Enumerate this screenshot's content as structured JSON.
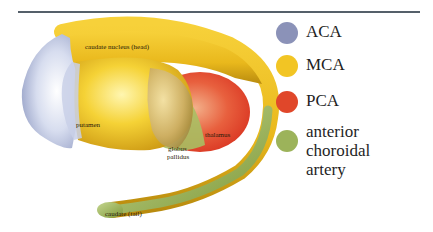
{
  "figure": {
    "divider": true,
    "structures": {
      "caudate_head": "caudate nucleus (head)",
      "putamen": "putamen",
      "globus_pallidus_line1": "globus",
      "globus_pallidus_line2": "pallidus",
      "thalamus": "thalamus",
      "caudate_tail": "caudate (tail)"
    }
  },
  "legend": {
    "items": [
      {
        "label": "ACA",
        "color": "#8b92b8"
      },
      {
        "label": "MCA",
        "color": "#f2c524"
      },
      {
        "label": "PCA",
        "color": "#e0472a"
      },
      {
        "label_line1": "anterior choroidal",
        "label_line2": "artery",
        "color": "#9cb35a"
      }
    ]
  },
  "colors": {
    "aca": "#8b92b8",
    "mca": "#f2c524",
    "pca": "#e0472a",
    "anterior_choroidal": "#9cb35a",
    "rule": "#55606a"
  }
}
